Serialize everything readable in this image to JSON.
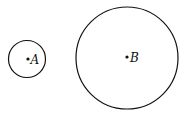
{
  "diagram": {
    "colors": {
      "stroke": "#111111",
      "background": "#ffffff"
    },
    "circles": [
      {
        "label": "A",
        "cx": 27,
        "cy": 59,
        "r": 18.5
      },
      {
        "label": "B",
        "cx": 127,
        "cy": 58,
        "r": 51
      }
    ]
  }
}
